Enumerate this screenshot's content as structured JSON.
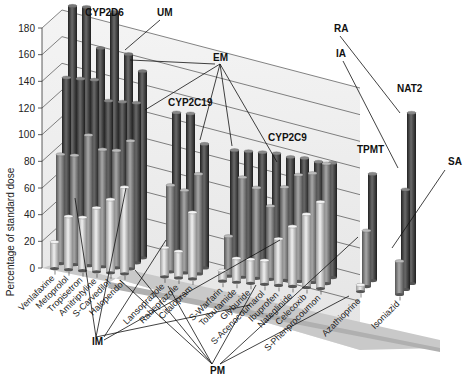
{
  "chart_data": {
    "type": "bar",
    "subtype": "3d-cylinder-grouped",
    "title": "",
    "xlabel": "",
    "ylabel": "Percentage of standard dose",
    "ylim": [
      0,
      180
    ],
    "yticks": [
      0,
      20,
      40,
      60,
      80,
      100,
      120,
      140,
      160,
      180
    ],
    "grid": true,
    "categories": [
      "Venlafaxine",
      "Metoprolol",
      "Tropisetron",
      "Amitriptyline",
      "S-Carvedilol",
      "Haloperidol",
      "Lansoprazole",
      "Rabeprazole",
      "Citalopram",
      "S-Warfarin",
      "Tolbutamide",
      "Glyburide",
      "S-Acenocoumarol",
      "Ibuprofen",
      "Nateglinide",
      "Celecoxib",
      "S-Phenprocoumon",
      "Azathioprine",
      "Isoniazid"
    ],
    "groups": [
      {
        "name": "CYP2D6",
        "categories": [
          "Venlafaxine",
          "Metoprolol",
          "Tropisetron",
          "Amitriptyline",
          "S-Carvedilol",
          "Haloperidol"
        ]
      },
      {
        "name": "CYP2C19",
        "categories": [
          "Lansoprazole",
          "Rabeprazole",
          "Citalopram"
        ]
      },
      {
        "name": "CYP2C9",
        "categories": [
          "S-Warfarin",
          "Tolbutamide",
          "Glyburide",
          "S-Acenocoumarol",
          "Ibuprofen",
          "Nateglinide",
          "Celecoxib",
          "S-Phenprocoumon"
        ]
      },
      {
        "name": "TPMT",
        "categories": [
          "Azathioprine"
        ]
      },
      {
        "name": "NAT2",
        "categories": [
          "Isoniazid"
        ]
      }
    ],
    "series": [
      {
        "name": "PM",
        "values": [
          20,
          40,
          40,
          48,
          55,
          65,
          22,
          20,
          50,
          8,
          18,
          18,
          18,
          35,
          45,
          55,
          65,
          5,
          null
        ]
      },
      {
        "name": "IM",
        "values": [
          82,
          82,
          98,
          88,
          88,
          96,
          65,
          62,
          75,
          30,
          75,
          68,
          55,
          70,
          80,
          82,
          90,
          42,
          null
        ]
      },
      {
        "name": "EM",
        "values": [
          135,
          135,
          135,
          120,
          120,
          120,
          115,
          115,
          93,
          90,
          90,
          90,
          90,
          88,
          88,
          86,
          86,
          80,
          null
        ]
      },
      {
        "name": "UM",
        "values": [
          185,
          185,
          155,
          183,
          152,
          140,
          null,
          null,
          null,
          null,
          null,
          null,
          null,
          null,
          null,
          null,
          null,
          null,
          null
        ]
      },
      {
        "name": "SA",
        "values": [
          null,
          null,
          null,
          null,
          null,
          null,
          null,
          null,
          null,
          null,
          null,
          null,
          null,
          null,
          null,
          null,
          null,
          null,
          25
        ]
      },
      {
        "name": "IA",
        "values": [
          null,
          null,
          null,
          null,
          null,
          null,
          null,
          null,
          null,
          null,
          null,
          null,
          null,
          null,
          null,
          null,
          null,
          null,
          75
        ]
      },
      {
        "name": "RA",
        "values": [
          null,
          null,
          null,
          null,
          null,
          null,
          null,
          null,
          null,
          null,
          null,
          null,
          null,
          null,
          null,
          null,
          null,
          null,
          128
        ]
      }
    ],
    "annotations": [
      "UM",
      "EM",
      "IM",
      "PM",
      "RA",
      "IA",
      "SA"
    ]
  },
  "labels": {
    "ylabel": "Percentage of standard dose",
    "groups": [
      "CYP2D6",
      "CYP2C19",
      "CYP2C9",
      "TPMT",
      "NAT2"
    ],
    "annotations": {
      "UM": "UM",
      "EM": "EM",
      "IM": "IM",
      "PM": "PM",
      "RA": "RA",
      "IA": "IA",
      "SA": "SA"
    }
  },
  "colors": {
    "pm": "#d6d6d6",
    "im": "#8a8a8a",
    "em": "#4a4a4a",
    "um": "#3a3a3a",
    "wall": "#ececec",
    "floor": "#c8c8c8"
  }
}
